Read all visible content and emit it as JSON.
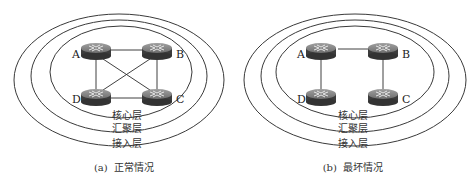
{
  "panels": [
    {
      "id": "a",
      "caption": "(a)  正常情况",
      "layers": [
        "核心层",
        "汇聚层",
        "接入层"
      ],
      "nodes": [
        "A",
        "B",
        "C",
        "D"
      ],
      "links": [
        [
          "A",
          "B"
        ],
        [
          "A",
          "D"
        ],
        [
          "B",
          "C"
        ],
        [
          "D",
          "C"
        ],
        [
          "A",
          "C"
        ],
        [
          "B",
          "D"
        ]
      ]
    },
    {
      "id": "b",
      "caption": "(b)  最坏情况",
      "layers": [
        "核心层",
        "汇聚层",
        "接入层"
      ],
      "nodes": [
        "A",
        "B",
        "C",
        "D"
      ],
      "links": [
        [
          "A",
          "B"
        ],
        [
          "A",
          "D"
        ],
        [
          "B",
          "C"
        ]
      ]
    }
  ],
  "colors": {
    "ring": "#3a3a3a",
    "link": "#2a2a2a",
    "router_top": "#8a8a8a",
    "router_side": "#3c3c3c"
  }
}
